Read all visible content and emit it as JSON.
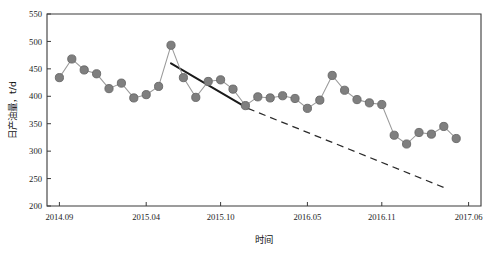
{
  "chart_data": {
    "type": "line",
    "title": "",
    "xlabel": "时间",
    "ylabel": "日产油量，t/d",
    "ylim": [
      200,
      550
    ],
    "ytick_labels": [
      "200",
      "250",
      "300",
      "350",
      "400",
      "450",
      "500",
      "550"
    ],
    "ytick_values": [
      200,
      250,
      300,
      350,
      400,
      450,
      500,
      550
    ],
    "xtick_labels": [
      "2014.09",
      "2015.04",
      "2015.10",
      "2016.05",
      "2016.11",
      "2017.06"
    ],
    "xtick_values": [
      0,
      7,
      13,
      20,
      26,
      33
    ],
    "xlim": [
      -1,
      34
    ],
    "grid": false,
    "legend": null,
    "series": [
      {
        "name": "日产油量",
        "marker": "circle",
        "color": "#7f7f7f",
        "x": [
          0,
          1,
          2,
          3,
          4,
          5,
          6,
          7,
          8,
          9,
          10,
          11,
          12,
          13,
          14,
          15,
          16,
          17,
          18,
          19,
          20,
          21,
          22,
          23,
          24,
          25,
          26,
          27,
          28,
          29,
          30,
          31,
          32
        ],
        "values": [
          434,
          468,
          448,
          441,
          414,
          424,
          397,
          403,
          418,
          493,
          434,
          398,
          427,
          430,
          413,
          383,
          399,
          397,
          401,
          396,
          378,
          393,
          438,
          411,
          394,
          388,
          385,
          329,
          313,
          334,
          331,
          345,
          323
        ]
      }
    ],
    "annotations": [
      {
        "name": "solid-trend-line",
        "style": "solid",
        "x1": 9.0,
        "y1": 460,
        "x2": 15.2,
        "y2": 378
      },
      {
        "name": "dashed-projection-line",
        "style": "dashed",
        "x1": 15.2,
        "y1": 378,
        "x2": 31.2,
        "y2": 232
      }
    ]
  },
  "axes": {
    "y_title": "日产油量，t/d",
    "x_title": "时间"
  }
}
